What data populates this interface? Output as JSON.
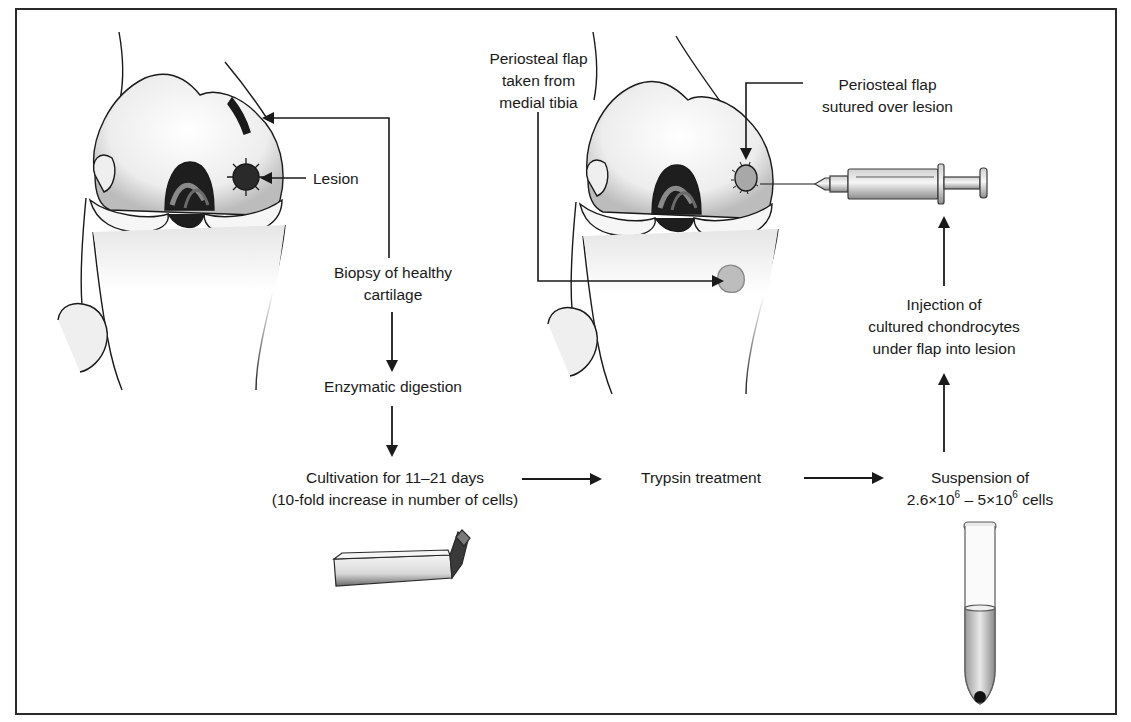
{
  "figure": {
    "colors": {
      "ink": "#1a1a1a",
      "bone_fill": "#f4f4f4",
      "shade": "#bdbdbd",
      "dark": "#2a2a2a",
      "background": "#ffffff"
    }
  },
  "labels": {
    "lesion": "Lesion",
    "biopsy_line1": "Biopsy of healthy",
    "biopsy_line2": "cartilage",
    "enzymatic": "Enzymatic digestion",
    "cultivation_line1": "Cultivation for 11–21 days",
    "cultivation_line2": "(10-fold increase in number of cells)",
    "trypsin": "Trypsin treatment",
    "suspension_line1": "Suspension of",
    "suspension_line2_a": "2.6×10",
    "suspension_exp1": "6",
    "suspension_line2_b": " – 5×10",
    "suspension_exp2": "6",
    "suspension_line2_c": " cells",
    "flap_taken_line1": "Periosteal flap",
    "flap_taken_line2": "taken from",
    "flap_taken_line3": "medial tibia",
    "flap_sutured_line1": "Periosteal flap",
    "flap_sutured_line2": "sutured over lesion",
    "injection_line1": "Injection of",
    "injection_line2": "cultured chondrocytes",
    "injection_line3": "under flap into lesion"
  },
  "flow_steps": [
    "Biopsy of healthy cartilage",
    "Enzymatic digestion",
    "Cultivation for 11–21 days (10-fold increase in number of cells)",
    "Trypsin treatment",
    "Suspension of 2.6×10^6 – 5×10^6 cells",
    "Injection of cultured chondrocytes under flap into lesion"
  ],
  "icons": {
    "knee_left": "knee-joint-with-lesion-illustration",
    "knee_right": "knee-joint-with-flap-illustration",
    "syringe": "syringe-icon",
    "culture_flask": "culture-flask-icon",
    "test_tube": "test-tube-icon"
  }
}
